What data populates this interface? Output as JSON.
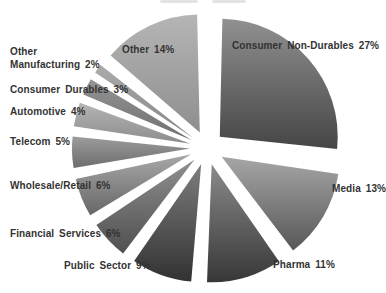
{
  "background_color": "#ffffff",
  "label_text_color": "#333333",
  "chart_data": {
    "type": "pie",
    "title": "",
    "unit": "%",
    "exploded": true,
    "direction": "clockwise",
    "start_angle_deg": 0,
    "legend": "none (direct slice labels)",
    "slices": [
      {
        "slug": "consumer-non-durables",
        "label": "Consumer Non-Durables",
        "value": 27,
        "label_text": "Consumer Non-Durables 27%",
        "label_lines": [
          "Consumer Non-Durables 27%"
        ],
        "color_top": "#909090",
        "color_bottom": "#454545"
      },
      {
        "slug": "media",
        "label": "Media",
        "value": 13,
        "label_text": "Media 13%",
        "label_lines": [
          "Media 13%"
        ],
        "color_top": "#a6a6a6",
        "color_bottom": "#575757"
      },
      {
        "slug": "pharma",
        "label": "Pharma",
        "value": 11,
        "label_text": "Pharma 11%",
        "label_lines": [
          "Pharma 11%"
        ],
        "color_top": "#8a8a8a",
        "color_bottom": "#373737"
      },
      {
        "slug": "public-sector",
        "label": "Public Sector",
        "value": 9,
        "label_text": "Public Sector 9%",
        "label_lines": [
          "Public Sector 9%"
        ],
        "color_top": "#7d7d7d",
        "color_bottom": "#323232"
      },
      {
        "slug": "financial-services",
        "label": "Financial Services",
        "value": 6,
        "label_text": "Financial Services 6%",
        "label_lines": [
          "Financial Services 6%"
        ],
        "color_top": "#8f8f8f",
        "color_bottom": "#4f4f4f"
      },
      {
        "slug": "wholesale-retail",
        "label": "Wholesale/Retail",
        "value": 6,
        "label_text": "Wholesale/Retail 6%",
        "label_lines": [
          "Wholesale/Retail 6%"
        ],
        "color_top": "#a8a8a8",
        "color_bottom": "#666666"
      },
      {
        "slug": "telecom",
        "label": "Telecom",
        "value": 5,
        "label_text": "Telecom 5%",
        "label_lines": [
          "Telecom 5%"
        ],
        "color_top": "#9c9c9c",
        "color_bottom": "#6d6d6d"
      },
      {
        "slug": "automotive",
        "label": "Automotive",
        "value": 4,
        "label_text": "Automotive 4%",
        "label_lines": [
          "Automotive 4%"
        ],
        "color_top": "#b4b4b4",
        "color_bottom": "#8c8c8c"
      },
      {
        "slug": "consumer-durables",
        "label": "Consumer Durables",
        "value": 3,
        "label_text": "Consumer Durables 3%",
        "label_lines": [
          "Consumer Durables 3%"
        ],
        "color_top": "#949494",
        "color_bottom": "#6f6f6f"
      },
      {
        "slug": "other-manufacturing",
        "label": "Other Manufacturing",
        "value": 2,
        "label_text": "Other Manufacturing 2%",
        "label_lines": [
          "Other",
          "Manufacturing 2%"
        ],
        "color_top": "#ababab",
        "color_bottom": "#858585"
      },
      {
        "slug": "other",
        "label": "Other",
        "value": 14,
        "label_text": "Other 14%",
        "label_lines": [
          "Other 14%"
        ],
        "color_top": "#b5b5b5",
        "color_bottom": "#8e8e8e"
      }
    ]
  }
}
